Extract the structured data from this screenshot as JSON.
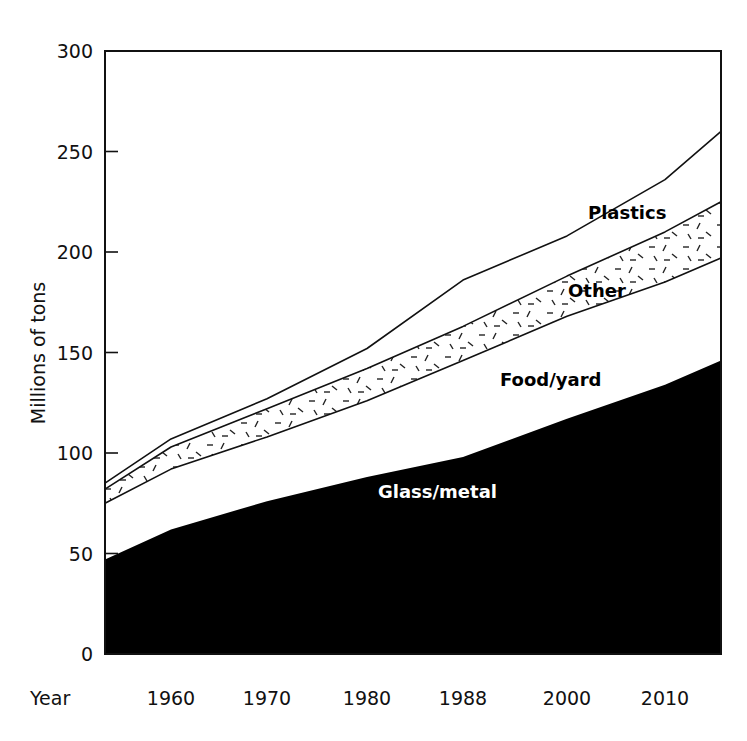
{
  "chart_data": {
    "type": "area",
    "stacked": true,
    "title": "",
    "xlabel": "Year",
    "ylabel": "Millions of tons",
    "ylim": [
      0,
      300
    ],
    "yticks": [
      0,
      50,
      100,
      150,
      200,
      250,
      300
    ],
    "x_tick_labels": [
      "1960",
      "1970",
      "1980",
      "1988",
      "2000",
      "2010"
    ],
    "x_axis_prefix_label": "Year",
    "grid": false,
    "legend": "inline labels",
    "x": [
      "start",
      "1960",
      "1970",
      "1980",
      "1988",
      "2000",
      "2010",
      "end"
    ],
    "cumulative_series": [
      {
        "name": "Glass/metal",
        "top_values": [
          47,
          62,
          76,
          88,
          98,
          117,
          134,
          146
        ],
        "fill": "#000000",
        "label_color": "#ffffff"
      },
      {
        "name": "Food/yard",
        "top_values": [
          75,
          92,
          108,
          126,
          146,
          168,
          185,
          197
        ],
        "fill": "#ffffff",
        "label_color": "#000000"
      },
      {
        "name": "Other",
        "top_values": [
          82,
          103,
          122,
          142,
          163,
          188,
          210,
          225
        ],
        "fill": "dashed-texture",
        "label_color": "#000000"
      },
      {
        "name": "Plastics",
        "top_values": [
          85,
          107,
          127,
          152,
          186,
          208,
          236,
          260
        ],
        "fill": "#ffffff",
        "label_color": "#000000"
      }
    ],
    "series": [
      {
        "name": "Glass/metal",
        "values": [
          47,
          62,
          76,
          88,
          98,
          117,
          134,
          146
        ]
      },
      {
        "name": "Food/yard",
        "values": [
          28,
          30,
          32,
          38,
          48,
          51,
          51,
          51
        ]
      },
      {
        "name": "Other",
        "values": [
          7,
          11,
          14,
          16,
          17,
          20,
          25,
          28
        ]
      },
      {
        "name": "Plastics",
        "values": [
          3,
          4,
          5,
          10,
          23,
          20,
          26,
          35
        ]
      }
    ]
  },
  "labels": {
    "ylabel": "Millions of tons",
    "xlabel": "Year",
    "yticks": [
      "0",
      "50",
      "100",
      "150",
      "200",
      "250",
      "300"
    ],
    "xticks": [
      "1960",
      "1970",
      "1980",
      "1988",
      "2000",
      "2010"
    ],
    "series": {
      "plastics": "Plastics",
      "other": "Other",
      "food": "Food/yard",
      "glass": "Glass/metal"
    }
  }
}
